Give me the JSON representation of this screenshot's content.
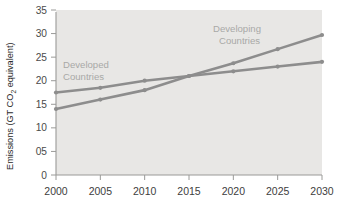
{
  "chart_data": {
    "type": "line",
    "title": "",
    "xlabel": "",
    "ylabel": "Emissions (GT CO2 equivalent)",
    "ylabel_parts": {
      "before": "Emissions (GT CO",
      "subscript": "2",
      "after": " equivalent)"
    },
    "categories": [
      "2000",
      "2005",
      "2010",
      "2015",
      "2020",
      "2025",
      "2030"
    ],
    "x": [
      2000,
      2005,
      2010,
      2015,
      2020,
      2025,
      2030
    ],
    "xlim": [
      2000,
      2030
    ],
    "ylim": [
      0,
      35
    ],
    "yticks": [
      0,
      5,
      10,
      15,
      20,
      25,
      30,
      35
    ],
    "ytick_labels": [
      "0",
      "05",
      "10",
      "15",
      "20",
      "25",
      "30",
      "35"
    ],
    "xtick_labels": [
      "2000",
      "2005",
      "2010",
      "2015",
      "2020",
      "2025",
      "2030"
    ],
    "grid": false,
    "legend_position": "inline-annotation",
    "series": [
      {
        "name": "Developed Countries",
        "label": "Developed",
        "label_line2": "Countries",
        "values": [
          17.5,
          18.5,
          20.0,
          21.0,
          22.0,
          23.0,
          24.0
        ],
        "color": "#8d8d8d"
      },
      {
        "name": "Developing Countries",
        "label": "Developing",
        "label_line2": "Countries",
        "values": [
          14.0,
          16.0,
          18.0,
          21.0,
          23.7,
          26.7,
          29.7
        ],
        "color": "#8d8d8d"
      }
    ]
  },
  "style": {
    "plot_background": "#e8e7e5",
    "page_background": "#ffffff",
    "axis_color": "#9a9a98",
    "line_color": "#8d8d8d",
    "annotation_color": "#a9a9a7",
    "tick_text_color": "#4a4a4a"
  }
}
